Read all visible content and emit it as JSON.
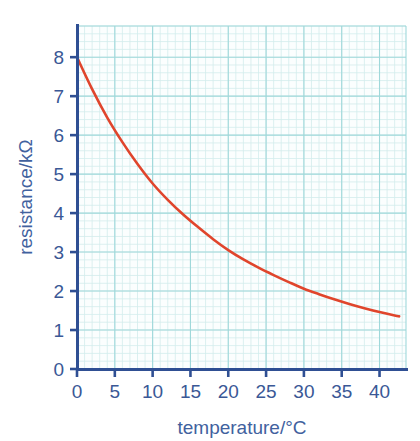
{
  "chart_data": {
    "type": "line",
    "title": "",
    "subtitle": "",
    "xlabel": "temperature/°C",
    "ylabel": "resistance/kΩ",
    "xlim": [
      0,
      43.5
    ],
    "ylim": [
      0,
      8.8
    ],
    "xticks": [
      "0",
      "5",
      "10",
      "15",
      "20",
      "25",
      "30",
      "35",
      "40"
    ],
    "xtick_values": [
      0,
      5,
      10,
      15,
      20,
      25,
      30,
      35,
      40
    ],
    "yticks": [
      "0",
      "1",
      "2",
      "3",
      "4",
      "5",
      "6",
      "7",
      "8"
    ],
    "ytick_values": [
      0,
      1,
      2,
      3,
      4,
      5,
      6,
      7,
      8
    ],
    "grid": true,
    "grid_major_step_x": 5,
    "grid_minor_step_x": 1,
    "grid_major_step_y": 1,
    "grid_minor_step_y": 0.2,
    "legend": null,
    "legend_position": "none",
    "annotations": [],
    "series": [
      {
        "name": "thermistor resistance",
        "color": "#e0452c",
        "line_width": 2.6,
        "x": [
          0,
          2,
          4,
          6,
          8,
          10,
          12,
          14,
          16,
          18,
          20,
          22,
          24,
          26,
          28,
          30,
          32,
          34,
          36,
          38,
          40,
          42,
          42.6
        ],
        "values": [
          8.0,
          7.18,
          6.45,
          5.82,
          5.26,
          4.76,
          4.34,
          3.97,
          3.64,
          3.33,
          3.05,
          2.81,
          2.6,
          2.41,
          2.23,
          2.06,
          1.92,
          1.79,
          1.67,
          1.56,
          1.46,
          1.37,
          1.35
        ]
      }
    ]
  },
  "colors": {
    "curve": "#e0452c",
    "axis": "#2f4f93",
    "tick_text": "#3a5896",
    "axis_title": "#41619e",
    "grid_major": "#9fd8da",
    "grid_minor": "#d3ecec",
    "plot_background": "#fbfefe",
    "page_background": "#ffffff"
  },
  "geometry": {
    "plot_left": 77,
    "plot_right": 406,
    "plot_top": 26,
    "plot_bottom": 369
  }
}
